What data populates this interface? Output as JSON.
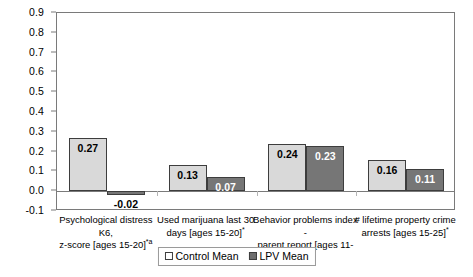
{
  "chart_data": {
    "type": "bar",
    "title": "",
    "xlabel": "",
    "ylabel": "",
    "ylim": [
      -0.1,
      0.9
    ],
    "ytick_labels": [
      "0.9",
      "0.8",
      "0.7",
      "0.6",
      "0.5",
      "0.4",
      "0.3",
      "0.2",
      "0.1",
      "0.0",
      "-0.1"
    ],
    "ytick_values": [
      0.9,
      0.8,
      0.7,
      0.6,
      0.5,
      0.4,
      0.3,
      0.2,
      0.1,
      0.0,
      -0.1
    ],
    "grid": false,
    "legend_position": "bottom-center",
    "categories": [
      "Psychological distress K6, z-score [ages 15-20]*a",
      "Used marijuana last 30 days [ages 15-20]*",
      "Behavior problems index - parent report [ages 11-20]",
      "# lifetime property crime arrests [ages 15-25]*"
    ],
    "category_lines": [
      [
        "Psychological distress K6,",
        "z-score [ages 15-20]",
        "*a"
      ],
      [
        "Used marijuana last 30",
        "days [ages 15-20]",
        "*"
      ],
      [
        "Behavior problems index -",
        "parent report [ages 11-20]",
        ""
      ],
      [
        "# lifetime property crime",
        "arrests [ages 15-25]",
        "*"
      ]
    ],
    "series": [
      {
        "name": "Control Mean",
        "color": "#d9d9d9",
        "values": [
          0.27,
          0.13,
          0.24,
          0.16
        ],
        "labels": [
          "0.27",
          "0.13",
          "0.24",
          "0.16"
        ]
      },
      {
        "name": "LPV Mean",
        "color": "#767676",
        "values": [
          -0.02,
          0.07,
          0.23,
          0.11
        ],
        "labels": [
          "-0.02",
          "0.07",
          "0.23",
          "0.11"
        ]
      }
    ]
  },
  "legend": {
    "entries": [
      {
        "label": "Control Mean",
        "swatch": "control"
      },
      {
        "label": "LPV Mean",
        "swatch": "lpv"
      }
    ]
  },
  "colors": {
    "control_bar": "#d9d9d9",
    "lpv_bar": "#767676",
    "axis": "#7a7a7a",
    "bar_border": "#3d3d3d",
    "text": "#000000",
    "background": "#ffffff"
  }
}
